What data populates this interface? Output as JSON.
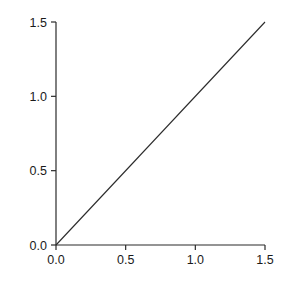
{
  "chart_data": {
    "type": "scatter",
    "title": "",
    "xlabel": "Predicted (m)",
    "ylabel": "Observed (m)",
    "xlim": [
      0.0,
      1.5
    ],
    "ylim": [
      0.0,
      1.5
    ],
    "xticks": [
      "0.0",
      "0.5",
      "1.0",
      "1.5"
    ],
    "yticks": [
      "0.0",
      "0.5",
      "1.0",
      "1.5"
    ],
    "xtick_values": [
      0.0,
      0.5,
      1.0,
      1.5
    ],
    "ytick_values": [
      0.0,
      0.5,
      1.0,
      1.5
    ],
    "grid": false,
    "legend": "none",
    "marker": "open-circle",
    "marker_size": 4.2,
    "marker_color": "#555555",
    "line_color": "#2b2b2b",
    "axis_color": "#2b2b2b",
    "background": "#ffffff",
    "reference_line": {
      "name": "1:1 line",
      "type": "identity",
      "x": [
        0.0,
        1.5
      ],
      "y": [
        0.0,
        1.5
      ]
    },
    "series": [
      {
        "name": "Observations",
        "points": [
          {
            "x": 0.1,
            "y": 0.105
          },
          {
            "x": 0.115,
            "y": 0.115
          },
          {
            "x": 0.125,
            "y": 0.125
          },
          {
            "x": 0.135,
            "y": 0.18
          },
          {
            "x": 0.27,
            "y": 0.2
          },
          {
            "x": 0.35,
            "y": 0.205
          },
          {
            "x": 0.415,
            "y": 0.385
          },
          {
            "x": 0.425,
            "y": 0.375
          },
          {
            "x": 0.52,
            "y": 0.46
          },
          {
            "x": 0.525,
            "y": 0.4
          },
          {
            "x": 0.615,
            "y": 0.59
          },
          {
            "x": 1.4,
            "y": 1.12
          }
        ]
      }
    ]
  }
}
